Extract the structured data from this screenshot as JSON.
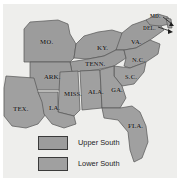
{
  "figure": {
    "type": "thematic-map",
    "region": "United States South"
  },
  "colors": {
    "upper_south_fill": "#9c9c9c",
    "lower_south_fill": "#a0a0a0",
    "other_land_fill": "#eeeeec",
    "water_fill": "#ffffff",
    "border_stroke": "#555555",
    "label_text": "#2b2b2b"
  },
  "states": [
    {
      "abbr": "MO.",
      "group": "Upper South",
      "x": 40,
      "y": 38
    },
    {
      "abbr": "KY.",
      "group": "Upper South",
      "x": 97,
      "y": 44
    },
    {
      "abbr": "MD.",
      "group": "Upper South",
      "x": 152,
      "y": 15
    },
    {
      "abbr": "DEL.",
      "group": "Upper South",
      "x": 145,
      "y": 27
    },
    {
      "abbr": "VA.",
      "group": "Upper South",
      "x": 131,
      "y": 38
    },
    {
      "abbr": "TENN.",
      "group": "Upper South",
      "x": 87,
      "y": 61
    },
    {
      "abbr": "N.C.",
      "group": "Upper South",
      "x": 134,
      "y": 58
    },
    {
      "abbr": "ARK.",
      "group": "Upper South",
      "x": 45,
      "y": 74
    },
    {
      "abbr": "S.C.",
      "group": "Lower South",
      "x": 127,
      "y": 74
    },
    {
      "abbr": "MISS.",
      "group": "Lower South",
      "x": 67,
      "y": 91
    },
    {
      "abbr": "ALA.",
      "group": "Lower South",
      "x": 90,
      "y": 89
    },
    {
      "abbr": "GA.",
      "group": "Lower South",
      "x": 113,
      "y": 87
    },
    {
      "abbr": "TEX.",
      "group": "Lower South",
      "x": 14,
      "y": 106
    },
    {
      "abbr": "LA.",
      "group": "Lower South",
      "x": 50,
      "y": 105
    },
    {
      "abbr": "FLA.",
      "group": "Lower South",
      "x": 131,
      "y": 123
    }
  ],
  "legend": {
    "items": [
      {
        "label": "Upper South",
        "swatch_color": "#9c9c9c"
      },
      {
        "label": "Lower South",
        "swatch_color": "#a0a0a0"
      }
    ]
  }
}
